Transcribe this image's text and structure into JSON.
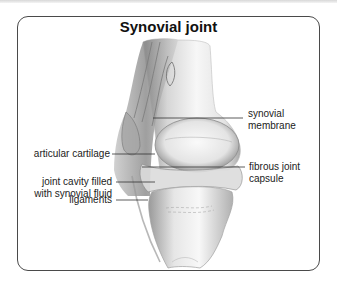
{
  "diagram": {
    "title": "Synovial joint",
    "labels": {
      "synovial_membrane": [
        "synovial",
        "membrane"
      ],
      "articular_cartilage": "articular cartilage",
      "fibrous_joint_capsule": [
        "fibrous joint",
        "capsule"
      ],
      "joint_cavity": [
        "joint cavity filled",
        "with synovial fluid"
      ],
      "ligaments": "ligaments"
    },
    "colors": {
      "frame": "#4a4a4a",
      "leader": "#333333",
      "bone_light": "#f4f4f4",
      "bone_shade": "#9a9a9a"
    }
  }
}
